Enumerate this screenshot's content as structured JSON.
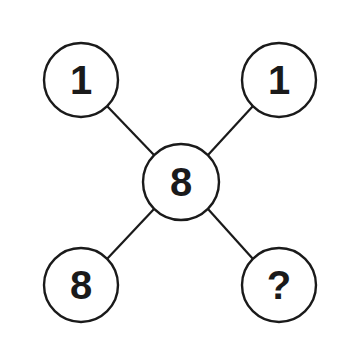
{
  "diagram": {
    "type": "number-puzzle",
    "colors": {
      "stroke": "#1a1a1a",
      "background": "#ffffff",
      "text": "#1a1a1a"
    },
    "nodes": [
      {
        "id": "top-left",
        "label": "1",
        "cx": 81,
        "cy": 80,
        "r": 37
      },
      {
        "id": "top-right",
        "label": "1",
        "cx": 279,
        "cy": 80,
        "r": 37
      },
      {
        "id": "center",
        "label": "8",
        "cx": 181,
        "cy": 182,
        "r": 38
      },
      {
        "id": "bottom-left",
        "label": "8",
        "cx": 81,
        "cy": 285,
        "r": 37
      },
      {
        "id": "bottom-right",
        "label": "?",
        "cx": 279,
        "cy": 285,
        "r": 37
      }
    ],
    "edges": [
      {
        "from": "top-left",
        "to": "center"
      },
      {
        "from": "top-right",
        "to": "center"
      },
      {
        "from": "bottom-left",
        "to": "center"
      },
      {
        "from": "bottom-right",
        "to": "center"
      }
    ]
  }
}
